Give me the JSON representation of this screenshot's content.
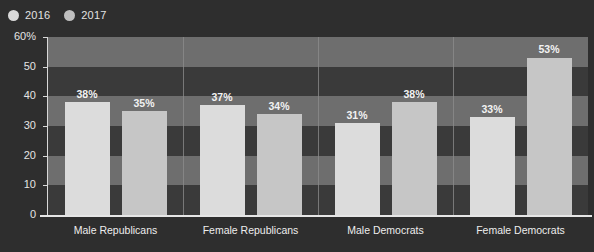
{
  "legend": {
    "entries": [
      {
        "label": "2016",
        "color": "#d9d9d9",
        "icon": "circle-marker-icon"
      },
      {
        "label": "2017",
        "color": "#bfbfbf",
        "icon": "circle-marker-icon"
      }
    ]
  },
  "axis": {
    "y_ticks": [
      "60%",
      "50",
      "40",
      "30",
      "20",
      "10",
      "0"
    ],
    "y_values": [
      60,
      50,
      40,
      30,
      20,
      10,
      0
    ]
  },
  "colors": {
    "background": "#2e2e2e",
    "band_light": "#6e6e6e",
    "band_dark": "#3a3a3a",
    "bar_2016": "#dcdcdc",
    "bar_2017": "#c6c6c6",
    "axis": "#e6e6e6",
    "separator": "#8d8d8d",
    "text": "#eeeeee"
  },
  "chart_data": {
    "type": "bar",
    "title": "",
    "xlabel": "",
    "ylabel": "",
    "ylim": [
      0,
      60
    ],
    "ytick_values": [
      0,
      10,
      20,
      30,
      40,
      50,
      60
    ],
    "grid": false,
    "banded_background": true,
    "legend_position": "top-left",
    "categories": [
      "Male Republicans",
      "Female Republicans",
      "Male Democrats",
      "Female Democrats"
    ],
    "series": [
      {
        "name": "2016",
        "values": [
          38,
          37,
          31,
          33
        ],
        "labels": [
          "38%",
          "37%",
          "31%",
          "33%"
        ],
        "color": "#dcdcdc"
      },
      {
        "name": "2017",
        "values": [
          35,
          34,
          38,
          53
        ],
        "labels": [
          "35%",
          "34%",
          "38%",
          "53%"
        ],
        "color": "#c6c6c6"
      }
    ]
  }
}
